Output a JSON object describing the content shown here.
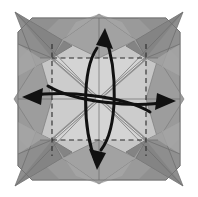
{
  "figure": {
    "title": "Origami folding diagram step",
    "type": "origami-diagram",
    "width": 198,
    "height": 197,
    "background_color": "#ffffff"
  },
  "palette": {
    "paper_base": "#9a9a9a",
    "paper_base_dark": "#8a8a8a",
    "paper_light": "#c8c8c8",
    "paper_lighter": "#d2d2d2",
    "flap_mid": "#a8a8a8",
    "flap_shadow": "#7e7e7e",
    "flap_highlight": "#b5b5b5",
    "crease_line": "#5a5a5a",
    "dashed_line": "#2b2b2b",
    "arrow_color": "#111111",
    "spoke_color": "#8f8f8f",
    "outline": "#6e6e6e"
  },
  "geometry": {
    "center": {
      "x": 99,
      "y": 99
    },
    "octagon_points": "32,18 166,18 180,32 180,166 166,180 32,180 18,166 18,32",
    "inner_square": {
      "left": 52,
      "top": 58,
      "right": 146,
      "bottom": 140
    },
    "inner_square_points": "52,58 146,58 146,140 52,140",
    "flap_tips": [
      {
        "name": "tip-top-left",
        "x": 15,
        "y": 12
      },
      {
        "name": "tip-top-right",
        "x": 183,
        "y": 12
      },
      {
        "name": "tip-bottom-left",
        "x": 15,
        "y": 186
      },
      {
        "name": "tip-bottom-right",
        "x": 183,
        "y": 186
      },
      {
        "name": "tip-top",
        "x": 99,
        "y": 14
      },
      {
        "name": "tip-bottom",
        "x": 99,
        "y": 184
      },
      {
        "name": "tip-left",
        "x": 14,
        "y": 99
      },
      {
        "name": "tip-right",
        "x": 184,
        "y": 99
      }
    ]
  },
  "creases": {
    "dashed_square_label": "valley-fold square",
    "dashed_vertical_left": {
      "x": 52,
      "y1": 40,
      "y2": 160
    },
    "dashed_vertical_right": {
      "x": 146,
      "y1": 40,
      "y2": 160
    },
    "solid_horizontal_mid": {
      "y": 99,
      "x1": 18,
      "x2": 180
    },
    "solid_vertical_mid": {
      "x": 99,
      "y1": 18,
      "y2": 180
    }
  },
  "arrows": [
    {
      "name": "arrow-up",
      "direction": "up",
      "path": "M 101,150 C 118,128 118,70 105,36",
      "head_points": "105,29 112,47 98,45",
      "label": "unfold upward"
    },
    {
      "name": "arrow-down",
      "direction": "down",
      "path": "M 97,48 C 82,70 82,128 96,162",
      "head_points": "97,169 90,151 104,153",
      "label": "unfold downward"
    },
    {
      "name": "arrow-left",
      "direction": "left",
      "path": "M 150,112 C 124,96 64,90 30,96",
      "head_points": "23,97 41,90 41,104",
      "label": "unfold to the left"
    },
    {
      "name": "arrow-right",
      "direction": "right",
      "path": "M 48,86 C 74,102 134,108 168,102",
      "head_points": "175,101 157,108 157,94",
      "label": "unfold to the right"
    }
  ],
  "spokes": [
    {
      "name": "spoke-nw",
      "x1": 99,
      "y1": 99,
      "x2": 52,
      "y2": 58
    },
    {
      "name": "spoke-ne",
      "x1": 99,
      "y1": 99,
      "x2": 146,
      "y2": 58
    },
    {
      "name": "spoke-sw",
      "x1": 99,
      "y1": 99,
      "x2": 52,
      "y2": 140
    },
    {
      "name": "spoke-se",
      "x1": 99,
      "y1": 99,
      "x2": 146,
      "y2": 140
    }
  ]
}
